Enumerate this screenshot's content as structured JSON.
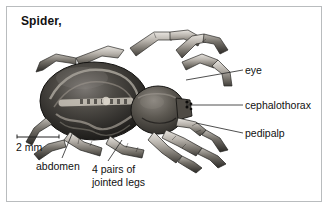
{
  "figure": {
    "title": "Spider,",
    "frame_color": "#b9bcbe",
    "background_color": "#ffffff",
    "ink_color": "#111111"
  },
  "scale_bar": {
    "label": "2 mm",
    "length_px": 44
  },
  "labels": {
    "eye": "eye",
    "cephalothorax": "cephalothorax",
    "pedipalp": "pedipalp",
    "abdomen": "abdomen",
    "legs_line1": "4 pairs of",
    "legs_line2": "jointed legs"
  },
  "icons": {
    "spider": "spider-illustration-icon",
    "scale_bar": "scale-bar-icon"
  }
}
